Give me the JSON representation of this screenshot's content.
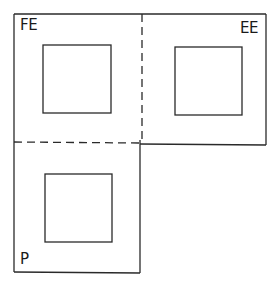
{
  "diagram": {
    "colors": {
      "stroke": "#2a2a2a",
      "background": "#ffffff"
    },
    "regions": [
      {
        "id": "fe",
        "label": "FE",
        "position": "top-left"
      },
      {
        "id": "ee",
        "label": "EE",
        "position": "top-right"
      },
      {
        "id": "p",
        "label": "P",
        "position": "bottom-left"
      }
    ],
    "dividers": [
      {
        "id": "vertical-dashed",
        "style": "dashed",
        "orientation": "vertical"
      },
      {
        "id": "horizontal-dashed",
        "style": "dashed",
        "orientation": "horizontal"
      }
    ]
  }
}
